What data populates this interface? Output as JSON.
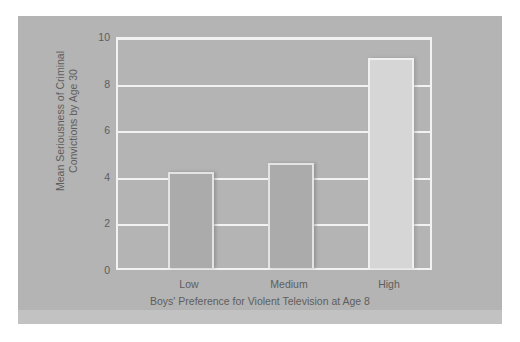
{
  "chart_data": {
    "type": "bar",
    "title": "",
    "subtitle": "",
    "categories": [
      "Low",
      "Medium",
      "High"
    ],
    "values": [
      4.2,
      4.6,
      9.2
    ],
    "series": [
      {
        "name": "Mean Seriousness of Criminal Convictions by Age 30",
        "values": [
          4.2,
          4.6,
          9.2
        ]
      }
    ],
    "xlabel": "Boys' Preference for Violent Television at Age 8",
    "ylabel": "Mean Seriousness of Criminal Convictions by Age 30",
    "ylabel_line1": "Mean Seriousness of Criminal",
    "ylabel_line2": "Convictions by Age 30",
    "ylim": [
      0,
      10
    ],
    "ytick_values": [
      10,
      8,
      6,
      4,
      2,
      0
    ],
    "ytick_labels": [
      "10",
      "8",
      "6",
      "4",
      "2",
      "0"
    ],
    "grid": true,
    "gridline_color": "#f2f2f2",
    "legend": false,
    "legend_position": "none",
    "bar_colors": [
      "#ababab",
      "#ababab",
      "#d6d6d6"
    ],
    "panel_background": "#b4b4b4",
    "page_background": "#ffffff",
    "text_color": "#5e5e5e"
  },
  "axis": {
    "y_ticks": [
      "10",
      "8",
      "6",
      "4",
      "2",
      "0"
    ],
    "x_ticks": [
      "Low",
      "Medium",
      "High"
    ],
    "x_title": "Boys' Preference for Violent Television at Age 8",
    "y_title_line1": "Mean Seriousness of Criminal",
    "y_title_line2": "Convictions by Age 30"
  }
}
